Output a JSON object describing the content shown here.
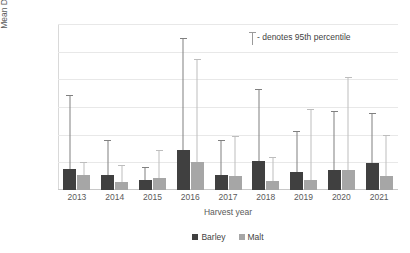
{
  "chart_data": {
    "type": "bar",
    "title": "",
    "xlabel": "Harvest year",
    "ylabel": "Mean DON (µg/kg)",
    "ylim": [
      0,
      300
    ],
    "yticks": [
      0,
      50,
      100,
      150,
      200,
      250,
      300
    ],
    "grid": true,
    "legend_position": "bottom",
    "categories": [
      "2013",
      "2014",
      "2015",
      "2016",
      "2017",
      "2018",
      "2019",
      "2020",
      "2021"
    ],
    "series": [
      {
        "name": "Barley",
        "color": "#404040",
        "values": [
          38,
          27,
          19,
          72,
          27,
          53,
          33,
          36,
          48
        ],
        "p95": [
          171,
          90,
          42,
          275,
          90,
          182,
          107,
          143,
          140
        ]
      },
      {
        "name": "Malt",
        "color": "#a6a6a6",
        "values": [
          28,
          15,
          21,
          50,
          26,
          17,
          19,
          37,
          26
        ],
        "p95": [
          50,
          45,
          72,
          237,
          98,
          59,
          147,
          205,
          100
        ]
      }
    ],
    "annotations": [
      {
        "text": "- denotes 95th percentile",
        "marker": "error-bar-symbol"
      }
    ]
  },
  "legend": {
    "items": [
      {
        "label": "Barley",
        "color": "#404040"
      },
      {
        "label": "Malt",
        "color": "#a6a6a6"
      }
    ]
  },
  "colors": {
    "barley": "#404040",
    "malt": "#a6a6a6",
    "whisker_barley": "#808080",
    "whisker_malt": "#bdbdbd",
    "gridline": "#e8e8e8",
    "text": "#5a5a5a"
  }
}
